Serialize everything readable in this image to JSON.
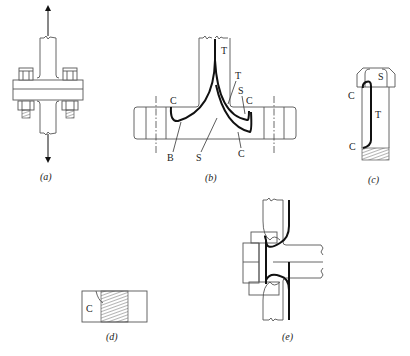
{
  "figure": {
    "panels": [
      {
        "id": "a",
        "caption": "(a)",
        "description": "Bolted flange joint under axial tension",
        "labels": []
      },
      {
        "id": "b",
        "caption": "(b)",
        "description": "Flange section showing failure locations",
        "labels": {
          "T_top": "T",
          "T_right": "T",
          "S_right": "S",
          "C_right": "C",
          "C_left": "C",
          "B": "B",
          "S_bottom": "S",
          "C_bottom": "C"
        }
      },
      {
        "id": "c",
        "caption": "(c)",
        "description": "Bolt showing failure locations",
        "labels": {
          "S": "S",
          "C_top": "C",
          "T": "T",
          "C_bottom": "C"
        }
      },
      {
        "id": "d",
        "caption": "(d)",
        "description": "Threaded hole with corrosion",
        "labels": {
          "C": "C"
        }
      },
      {
        "id": "e",
        "caption": "(e)",
        "description": "Gasketed flange joint with bolt",
        "labels": []
      }
    ],
    "colors": {
      "line": "#555555",
      "heavy_line": "#111111",
      "background": "#ffffff"
    }
  }
}
